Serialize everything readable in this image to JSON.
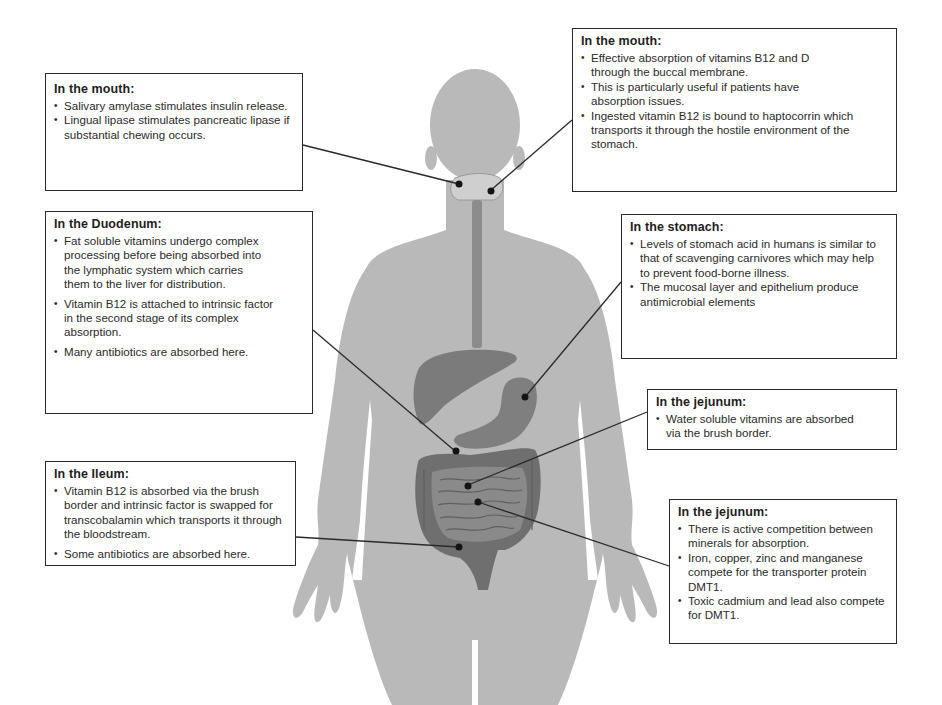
{
  "colors": {
    "body": "#b9b9b9",
    "organ": "#7b7b7b",
    "organ_dark": "#5f5f5f",
    "mouth": "#cfcfcf",
    "esophagus": "#8c8c8c",
    "marker": "#141414",
    "leader_line": "#2a2a2a",
    "box_border": "#2a2a2a"
  },
  "annotations": [
    {
      "id": "mouth-left",
      "title": "In the mouth:",
      "bullets": [
        "Salivary amylase stimulates insulin release.",
        "Lingual lipase stimulates pancreatic lipase if substantial chewing occurs."
      ]
    },
    {
      "id": "mouth-right",
      "title": "In the mouth:",
      "bullets": [
        "Effective absorption of vitamins B12 and D through the buccal membrane.",
        "This is particularly useful if patients have absorption issues.",
        "Ingested vitamin B12 is bound to haptocorrin which transports it through the hostile environment of the stomach."
      ]
    },
    {
      "id": "duodenum",
      "title": "In the Duodenum:",
      "bullets": [
        "Fat soluble vitamins undergo complex processing before being absorbed into the lymphatic system which carries them to the liver for distribution.",
        "Vitamin B12 is attached to intrinsic factor in the second stage of its complex absorption.",
        "Many antibiotics are absorbed here."
      ]
    },
    {
      "id": "stomach",
      "title": "In the stomach:",
      "bullets": [
        "Levels of stomach acid in humans is similar to that of scavenging carnivores which may help to prevent food-borne illness.",
        "The mucosal layer and epithelium produce antimicrobial elements"
      ]
    },
    {
      "id": "jejunum-1",
      "title": "In the jejunum:",
      "bullets": [
        "Water soluble vitamins are absorbed via the brush border."
      ]
    },
    {
      "id": "ileum",
      "title": "In the Ileum:",
      "bullets": [
        "Vitamin B12 is absorbed via the brush border and intrinsic factor is swapped for transcobalamin which transports it through the bloodstream.",
        "Some antibiotics are absorbed here."
      ]
    },
    {
      "id": "jejunum-2",
      "title": "In the jejunum:",
      "bullets": [
        "There is active competition between minerals for absorption.",
        "Iron, copper, zinc and manganese compete for the transporter protein DMT1.",
        "Toxic cadmium and lead also compete for DMT1."
      ]
    }
  ]
}
